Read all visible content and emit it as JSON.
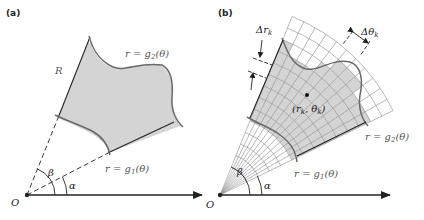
{
  "panels": [
    {
      "label": "(a)",
      "region_label": "R",
      "outer_curve_label": "r = g",
      "outer_curve_sub": "2",
      "outer_curve_arg": "(θ)",
      "inner_curve_label": "r = g",
      "inner_curve_sub": "1",
      "inner_curve_arg": "(θ)",
      "alpha_label": "α",
      "beta_label": "β",
      "origin_label": "O"
    },
    {
      "label": "(b)",
      "delta_r_label": "Δr",
      "delta_r_sub": "k",
      "delta_theta_label": "Δθ",
      "delta_theta_sub": "k",
      "point_label_open": "(r",
      "point_label_r_sub": "k",
      "point_label_mid": ", θ",
      "point_label_theta_sub": "k",
      "point_label_close": ")",
      "outer_curve_label": "r = g",
      "outer_curve_sub": "2",
      "outer_curve_arg": "(θ)",
      "inner_curve_label": "r = g",
      "inner_curve_sub": "1",
      "inner_curve_arg": "(θ)",
      "alpha_label": "α",
      "beta_label": "β",
      "origin_label": "O"
    }
  ],
  "colors": {
    "region_fill": "#d4d4d4",
    "curve": "#6a6a6a",
    "line": "#222222",
    "grid": "#8a8a8a"
  }
}
